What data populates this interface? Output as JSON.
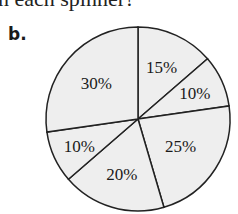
{
  "header": {
    "text": "n each spinner?"
  },
  "part": {
    "label": "b."
  },
  "chart_data": {
    "type": "pie",
    "title": "",
    "start_angle_deg_from_top": 0,
    "direction": "clockwise",
    "categories": [
      "Slice 1",
      "Slice 2",
      "Slice 3",
      "Slice 4",
      "Slice 5",
      "Slice 6"
    ],
    "values": [
      15,
      10,
      25,
      20,
      10,
      30
    ],
    "labels": [
      "15%",
      "10%",
      "25%",
      "20%",
      "10%",
      "30%"
    ],
    "fill_color": "#eeeeee",
    "stroke_color": "#222222",
    "legend": "none"
  }
}
